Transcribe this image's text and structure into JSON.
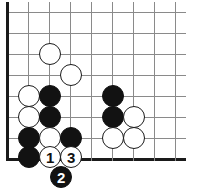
{
  "diagram": {
    "board": {
      "width": 204,
      "height": 194,
      "cell_size": 21,
      "origin_x": 7,
      "origin_y": 12,
      "columns": 9,
      "rows": 8,
      "grid_color": "#8a8a8a",
      "border_color": "#1a1a1a",
      "background_color": "#ffffff"
    },
    "stone_style": {
      "radius": 11,
      "black_color": "#121212",
      "white_color": "#ffffff",
      "white_outline": "#1a1a1a",
      "black_label_color": "#ffffff",
      "white_label_color": "#111111"
    },
    "stones": [
      {
        "name": "white-stone-c4",
        "color": "white",
        "cx": 50,
        "cy": 54,
        "label": ""
      },
      {
        "name": "white-stone-d5",
        "color": "white",
        "cx": 71,
        "cy": 75,
        "label": ""
      },
      {
        "name": "white-stone-b6",
        "color": "white",
        "cx": 29,
        "cy": 96,
        "label": ""
      },
      {
        "name": "black-stone-c6",
        "color": "black",
        "cx": 50,
        "cy": 96,
        "label": ""
      },
      {
        "name": "black-stone-f6",
        "color": "black",
        "cx": 113,
        "cy": 96,
        "label": ""
      },
      {
        "name": "white-stone-b7",
        "color": "white",
        "cx": 29,
        "cy": 117,
        "label": ""
      },
      {
        "name": "black-stone-c7",
        "color": "black",
        "cx": 50,
        "cy": 117,
        "label": ""
      },
      {
        "name": "black-stone-f7",
        "color": "black",
        "cx": 113,
        "cy": 117,
        "label": ""
      },
      {
        "name": "white-stone-g7",
        "color": "white",
        "cx": 134,
        "cy": 117,
        "label": ""
      },
      {
        "name": "black-stone-b8",
        "color": "black",
        "cx": 29,
        "cy": 138,
        "label": ""
      },
      {
        "name": "white-stone-c8",
        "color": "white",
        "cx": 50,
        "cy": 138,
        "label": ""
      },
      {
        "name": "black-stone-d8",
        "color": "black",
        "cx": 71,
        "cy": 138,
        "label": ""
      },
      {
        "name": "white-stone-f8",
        "color": "white",
        "cx": 113,
        "cy": 138,
        "label": ""
      },
      {
        "name": "white-stone-g8",
        "color": "white",
        "cx": 134,
        "cy": 138,
        "label": ""
      },
      {
        "name": "black-stone-b9",
        "color": "black",
        "cx": 29,
        "cy": 157,
        "label": ""
      },
      {
        "name": "white-move-1",
        "color": "white",
        "cx": 50,
        "cy": 157,
        "label": "1"
      },
      {
        "name": "white-move-3",
        "color": "white",
        "cx": 71,
        "cy": 157,
        "label": "3"
      },
      {
        "name": "black-move-2",
        "color": "black",
        "cx": 61,
        "cy": 177,
        "label": "2"
      }
    ],
    "move_sequence": [
      {
        "number": "1",
        "color": "white"
      },
      {
        "number": "2",
        "color": "black"
      },
      {
        "number": "3",
        "color": "white"
      }
    ]
  }
}
